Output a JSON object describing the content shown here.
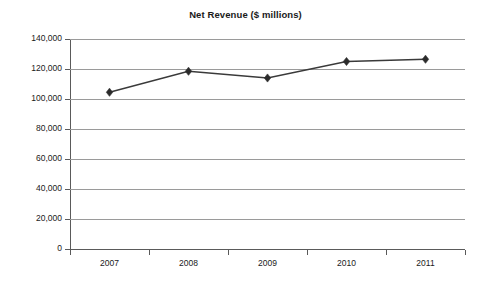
{
  "chart_data": {
    "type": "line",
    "title": "Net Revenue ($ millions)",
    "xlabel": "",
    "ylabel": "",
    "categories": [
      "2007",
      "2008",
      "2009",
      "2010",
      "2011"
    ],
    "values": [
      104500,
      118500,
      114000,
      125000,
      126500
    ],
    "series": [
      {
        "name": "Net Revenue",
        "values": [
          104500,
          118500,
          114000,
          125000,
          126500
        ]
      }
    ],
    "ylim": [
      0,
      140000
    ],
    "ytick_values": [
      0,
      20000,
      40000,
      60000,
      80000,
      100000,
      120000,
      140000
    ],
    "ytick_labels": [
      "0",
      "20,000",
      "40,000",
      "60,000",
      "80,000",
      "100,000",
      "120,000",
      "140,000"
    ],
    "xtick_labels": [
      "2007",
      "2008",
      "2009",
      "2010",
      "2011"
    ],
    "grid": true,
    "grid_axis": "y",
    "legend": false,
    "legend_position": "none",
    "marker": "diamond",
    "line_color": "#3a3a3a",
    "marker_color": "#2b2b2b",
    "grid_color": "#9a9a9a",
    "axis_color": "#5a5a5a",
    "background_color": "#ffffff",
    "text_color": "#1a1a1a"
  }
}
